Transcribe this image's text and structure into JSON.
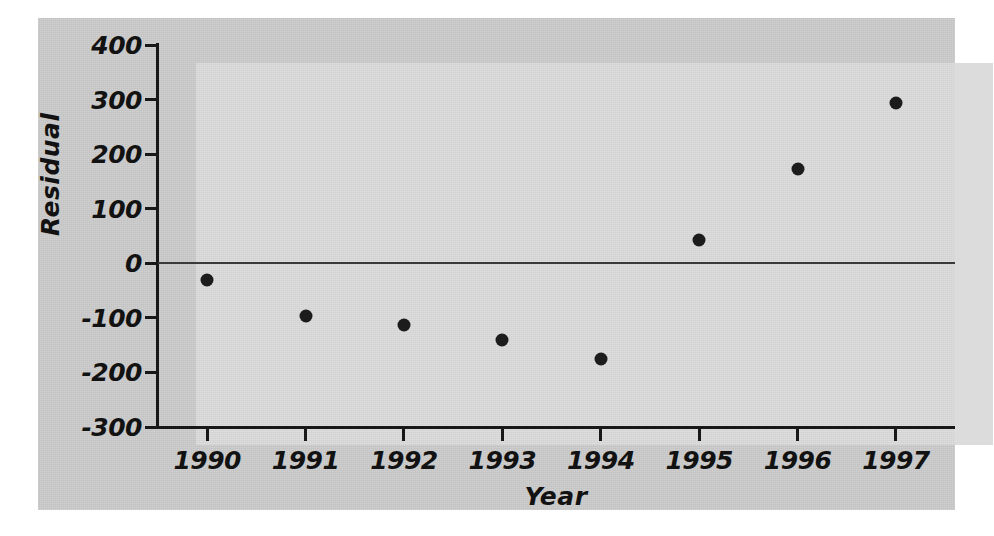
{
  "chart_data": {
    "type": "scatter",
    "title": "",
    "xlabel": "Year",
    "ylabel": "Residual",
    "x": [
      1990,
      1991,
      1992,
      1993,
      1994,
      1995,
      1996,
      1997
    ],
    "values": [
      -31,
      -96,
      -114,
      -141,
      -175,
      42,
      173,
      294
    ],
    "categories": [
      "1990",
      "1991",
      "1992",
      "1993",
      "1994",
      "1995",
      "1996",
      "1997"
    ],
    "xtick_labels": [
      "1990",
      "1991",
      "1992",
      "1993",
      "1994",
      "1995",
      "1996",
      "1997"
    ],
    "ytick_labels": [
      "400",
      "300",
      "200",
      "100",
      "0",
      "-100",
      "-200",
      "-300"
    ],
    "ytick_values": [
      400,
      300,
      200,
      100,
      0,
      -100,
      -200,
      -300
    ],
    "ylim": [
      -300,
      400
    ],
    "xlim": [
      1989.5,
      1997.6
    ],
    "grid": false,
    "legend": false,
    "reference_line": {
      "axis": "y",
      "value": 0,
      "label": "zero-residual-line"
    },
    "marker": {
      "shape": "circle",
      "color": "#1c1c1c",
      "size": 13
    }
  },
  "figure": {
    "background_color": "#cccccc",
    "panel_color": "#dcdcdc",
    "axis_color": "#181818",
    "page_color": "#ffffff"
  }
}
